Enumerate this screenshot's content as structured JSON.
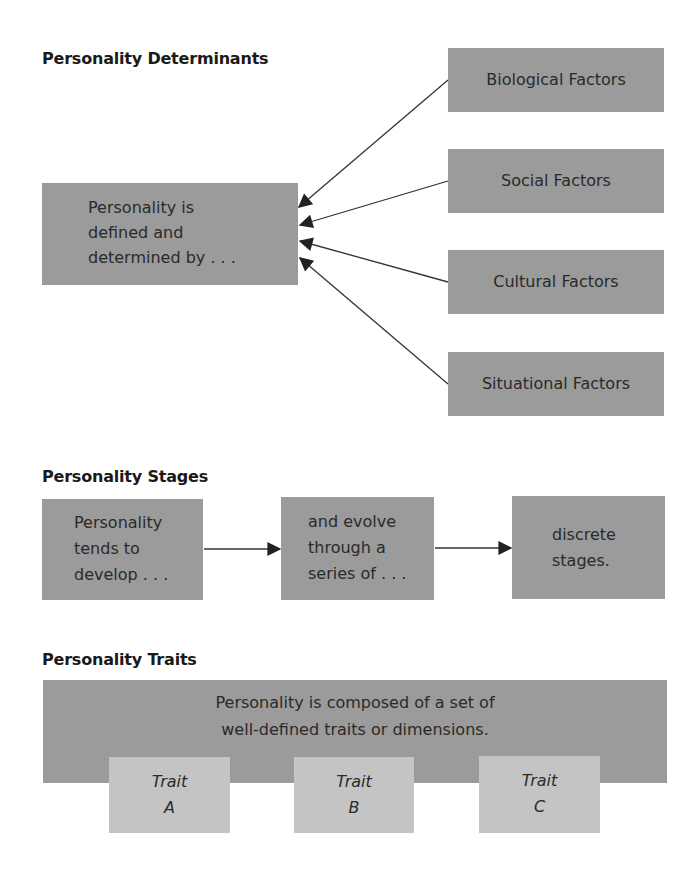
{
  "determinants": {
    "heading": "Personality Determinants",
    "center": {
      "lines": [
        "Personality is",
        "defined and",
        "determined by . . ."
      ]
    },
    "factors": [
      {
        "label": "Biological Factors"
      },
      {
        "label": "Social Factors"
      },
      {
        "label": "Cultural Factors"
      },
      {
        "label": "Situational Factors"
      }
    ]
  },
  "stages": {
    "heading": "Personality Stages",
    "boxes": [
      {
        "lines": [
          "Personality",
          "tends to",
          "develop . . ."
        ]
      },
      {
        "lines": [
          "and evolve",
          "through a",
          "series of . . ."
        ]
      },
      {
        "lines": [
          "discrete",
          "stages."
        ]
      }
    ]
  },
  "traits": {
    "heading": "Personality Traits",
    "main": {
      "lines": [
        "Personality is composed of a set of",
        "well-defined traits or dimensions."
      ]
    },
    "items": [
      {
        "line1": "Trait",
        "line2": "A"
      },
      {
        "line1": "Trait",
        "line2": "B"
      },
      {
        "line1": "Trait",
        "line2": "C"
      }
    ]
  },
  "colors": {
    "box_dark": "#9b9b9b",
    "box_light": "#c4c4c4",
    "arrow": "#222222"
  }
}
